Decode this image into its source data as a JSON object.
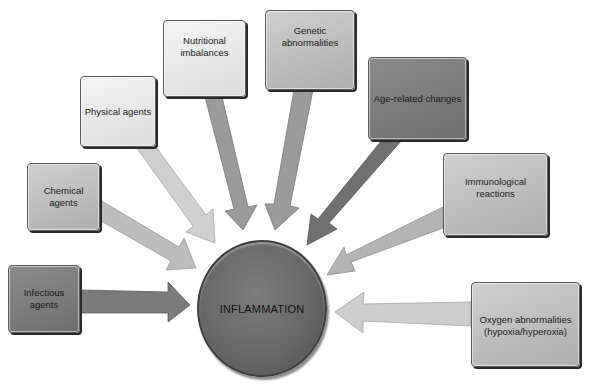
{
  "diagram": {
    "center": {
      "label": "INFLAMMATION"
    },
    "causes": [
      {
        "id": "infectious",
        "label": "Infectious agents"
      },
      {
        "id": "chemical",
        "label": "Chemical agents"
      },
      {
        "id": "physical",
        "label": "Physical agents"
      },
      {
        "id": "nutritional",
        "label": "Nutritional imbalances"
      },
      {
        "id": "genetic",
        "label": "Genetic abnormalities"
      },
      {
        "id": "age",
        "label": "Age-related changes"
      },
      {
        "id": "immunological",
        "label": "Immunological reactions"
      },
      {
        "id": "oxygen",
        "label": "Oxygen abnormalities (hypoxia/hyperoxia)"
      }
    ],
    "colors": {
      "light_fill": "#e8e8e8",
      "mid_fill": "#bdbdbd",
      "dark_fill": "#7a7a7a",
      "center_fill": "#666666"
    }
  }
}
